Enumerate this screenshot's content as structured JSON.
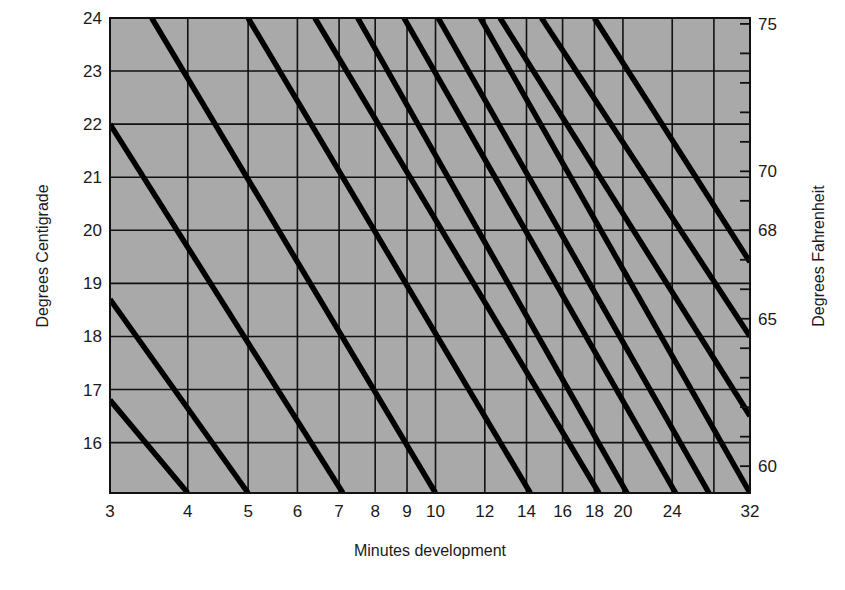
{
  "chart_data": {
    "type": "line",
    "title": "",
    "xlabel": "Minutes development",
    "ylabel": "Degrees Centigrade",
    "y2label": "Degrees Fahrenheit",
    "x_scale": "log",
    "x_ticks": [
      3,
      4,
      5,
      6,
      7,
      8,
      9,
      10,
      12,
      14,
      16,
      18,
      20,
      24,
      28,
      32
    ],
    "x_tick_labels": [
      "3",
      "4",
      "5",
      "6",
      "7",
      "8",
      "9",
      "10",
      "12",
      "14",
      "16",
      "18",
      "20",
      "24",
      "",
      "32"
    ],
    "xlim": [
      3,
      32
    ],
    "y_ticks": [
      16,
      17,
      18,
      19,
      20,
      21,
      22,
      23,
      24
    ],
    "y_tick_labels": [
      "16",
      "17",
      "18",
      "19",
      "20",
      "21",
      "22",
      "23",
      "24"
    ],
    "ylim": [
      15.05,
      24
    ],
    "y2_ticks": [
      60,
      61,
      62,
      63,
      64,
      65,
      66,
      67,
      68,
      69,
      70,
      71,
      72,
      73,
      74,
      75
    ],
    "y2_tick_labels": [
      "60",
      "65",
      "68",
      "70",
      "75"
    ],
    "grid": true,
    "background_color": "#a9a9a9",
    "line_color": "#000000",
    "series": [
      {
        "name": "line-1",
        "points": [
          [
            3,
            16.8
          ],
          [
            4,
            15.05
          ]
        ]
      },
      {
        "name": "line-2",
        "points": [
          [
            3,
            18.7
          ],
          [
            5,
            15.05
          ]
        ]
      },
      {
        "name": "line-3",
        "points": [
          [
            3,
            22.0
          ],
          [
            7.1,
            15.05
          ]
        ]
      },
      {
        "name": "line-4",
        "points": [
          [
            3.5,
            24.0
          ],
          [
            10.0,
            15.05
          ]
        ]
      },
      {
        "name": "line-5",
        "points": [
          [
            5.0,
            24.0
          ],
          [
            14.2,
            15.05
          ]
        ]
      },
      {
        "name": "line-6",
        "points": [
          [
            6.4,
            24.0
          ],
          [
            18.3,
            15.05
          ]
        ]
      },
      {
        "name": "line-7",
        "points": [
          [
            7.5,
            24.0
          ],
          [
            20.3,
            15.05
          ]
        ]
      },
      {
        "name": "line-8",
        "points": [
          [
            8.9,
            24.0
          ],
          [
            24.3,
            15.05
          ]
        ]
      },
      {
        "name": "line-9",
        "points": [
          [
            10.1,
            24.0
          ],
          [
            27.5,
            15.05
          ]
        ]
      },
      {
        "name": "line-10",
        "points": [
          [
            11.8,
            24.0
          ],
          [
            32.0,
            15.05
          ]
        ]
      },
      {
        "name": "line-11",
        "points": [
          [
            12.7,
            24.0
          ],
          [
            32.0,
            16.5
          ]
        ]
      },
      {
        "name": "line-12",
        "points": [
          [
            14.8,
            24.0
          ],
          [
            32.0,
            18.0
          ]
        ]
      },
      {
        "name": "line-13",
        "points": [
          [
            18.0,
            24.0
          ],
          [
            32.0,
            19.4
          ]
        ]
      }
    ]
  }
}
